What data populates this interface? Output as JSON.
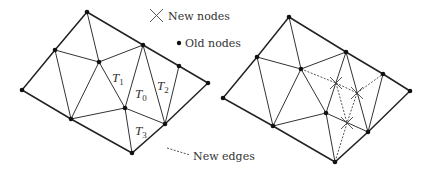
{
  "legend": {
    "new_nodes": "New nodes",
    "old_nodes": "Old nodes",
    "new_edges": "New edges"
  },
  "left_mesh": {
    "labels": {
      "T1": {
        "main": "T",
        "sub": "1"
      },
      "T0": {
        "main": "T",
        "sub": "0"
      },
      "T2": {
        "main": "T",
        "sub": "2"
      },
      "T3": {
        "main": "T",
        "sub": "3"
      }
    }
  },
  "icons": {
    "new_node": "x-mark-icon",
    "old_node": "filled-dot-icon",
    "new_edge": "dotted-line-icon"
  }
}
